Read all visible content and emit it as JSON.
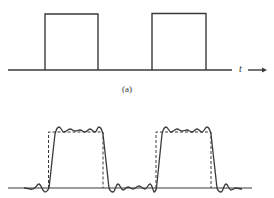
{
  "figure_a": {
    "label": "(a)",
    "axis_label": "t",
    "pulses": [
      {
        "x_start": 45,
        "x_end": 98
      },
      {
        "x_start": 152,
        "x_end": 206
      }
    ],
    "baseline_y": 70,
    "top_y": 14
  },
  "figure_b": {
    "description": "Square wave (dashed) with Fourier series approximation (solid) showing Gibbs ripple",
    "dashed_pulses": [
      {
        "x_start": 50,
        "x_end": 103
      },
      {
        "x_start": 157,
        "x_end": 211
      }
    ],
    "baseline_y": 188,
    "top_y": 132
  },
  "colors": {
    "line": "#333333"
  }
}
